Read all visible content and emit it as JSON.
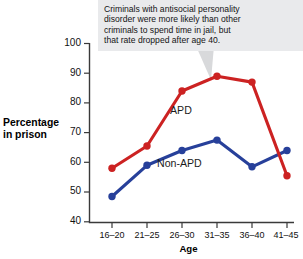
{
  "callout": {
    "name": "chart-annotation-callout",
    "lines": [
      "Criminals with antisocial personality",
      "disorder were more likely than other",
      "criminals to spend time in jail, but",
      "that rate dropped after age 40."
    ]
  },
  "axes": {
    "ylabel_line1": "Percentage",
    "ylabel_line2": "in prison",
    "xlabel": "Age",
    "yticks": [
      "40",
      "50",
      "60",
      "70",
      "80",
      "90",
      "100"
    ],
    "xticks": [
      "16–20",
      "21–25",
      "26–30",
      "31–35",
      "36–40",
      "41–45"
    ]
  },
  "series_labels": {
    "apd": "APD",
    "non_apd": "Non-APD"
  },
  "colors": {
    "apd": "#cc2222",
    "non_apd": "#27409a",
    "callout_bg": "#e9eaec",
    "axis": "#3a3a3a",
    "pointer": "#d8d9db"
  },
  "chart_data": {
    "type": "line",
    "title": "",
    "xlabel": "Age",
    "ylabel": "Percentage in prison",
    "categories": [
      "16–20",
      "21–25",
      "26–30",
      "31–35",
      "36–40",
      "41–45"
    ],
    "ylim": [
      40,
      100
    ],
    "ytick_step": 10,
    "grid": false,
    "legend": "inline-annotations",
    "series": [
      {
        "name": "APD",
        "color": "#cc2222",
        "values": [
          58,
          65.5,
          84,
          89,
          87,
          55.5
        ]
      },
      {
        "name": "Non-APD",
        "color": "#27409a",
        "values": [
          48.5,
          59,
          64,
          67.5,
          58.5,
          64
        ]
      }
    ],
    "annotations": [
      "Criminals with antisocial personality disorder were more likely than other criminals to spend time in jail, but that rate dropped after age 40."
    ]
  }
}
